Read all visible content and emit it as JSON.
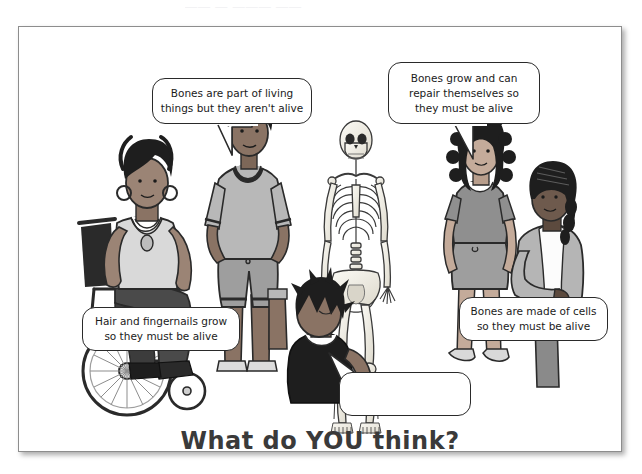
{
  "page": {
    "top_ghost_text": "—— — ——— ——",
    "title": "What do YOU think?",
    "border_color": "#8d8d8d",
    "background": "#ffffff"
  },
  "bubbles": [
    {
      "id": "bubble-1",
      "name": "speech-bubble-standing-boy",
      "speaker": "standing-boy",
      "lines": [
        "Bones are part of living",
        "things but they aren't alive"
      ],
      "full_text": "Bones are part of living things but they aren't alive"
    },
    {
      "id": "bubble-2",
      "name": "speech-bubble-curly-hair-girl",
      "speaker": "curly-hair-girl",
      "lines": [
        "Bones grow and can",
        "repair themselves so",
        "they must be alive"
      ],
      "full_text": "Bones grow and can repair themselves so they must be alive"
    },
    {
      "id": "bubble-3",
      "name": "speech-bubble-wheelchair-girl",
      "speaker": "wheelchair-girl",
      "lines": [
        "Hair and fingernails grow",
        "so they must be alive"
      ],
      "full_text": "Hair and fingernails grow so they must be alive"
    },
    {
      "id": "bubble-4",
      "name": "speech-bubble-seated-girl",
      "speaker": "seated-girl",
      "lines": [
        "Bones are made of cells",
        "so they must be alive"
      ],
      "full_text": "Bones are made of cells so they must be alive"
    },
    {
      "id": "bubble-5",
      "name": "speech-bubble-blank",
      "speaker": "spiky-hair-boy",
      "lines": [],
      "full_text": ""
    }
  ],
  "figures": [
    {
      "name": "wheelchair-girl",
      "description": "girl in wheelchair with hoop earrings and necklaces"
    },
    {
      "name": "standing-boy",
      "description": "boy standing with hands in pockets, v-neck tee and shorts"
    },
    {
      "name": "spiky-hair-boy",
      "description": "boy with spiky hair in dark tank top, seated on floor"
    },
    {
      "name": "skeleton",
      "description": "human skeleton anatomical model"
    },
    {
      "name": "curly-hair-girl",
      "description": "girl with long curly hair, tee and skirt"
    },
    {
      "name": "seated-girl",
      "description": "girl with braided hair in cardigan, seated"
    }
  ],
  "colors": {
    "ink": "#1b1b1b",
    "outline": "#2a2a2a",
    "title": "#3a3a3a",
    "skin_dark": "#6e5a4d",
    "skin_mid": "#9b8475",
    "cloth_light": "#c9c9c9",
    "cloth_mid": "#9e9e9e",
    "cloth_dark": "#5c5c5c",
    "hair_black": "#1e1e1e",
    "bone": "#f2efe6"
  }
}
